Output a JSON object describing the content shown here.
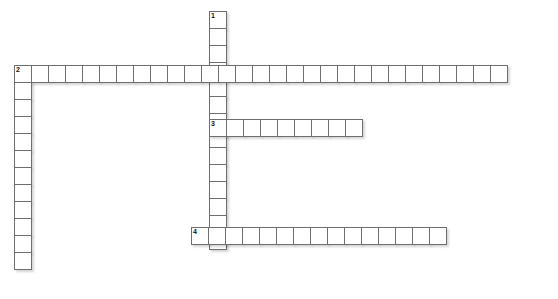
{
  "puzzle": {
    "title": "Crossword Grid",
    "width": 558,
    "height": 299,
    "cell_size": 18,
    "colors": {
      "cell_fill": "#ffffff",
      "cell_border": "#6e6e6e",
      "page_background": "#ffffff",
      "clue_number_text": "#111111",
      "shadow": "rgba(0,0,0,0.16)"
    },
    "entries": [
      {
        "number": "1",
        "direction": "down",
        "origin": {
          "x": 209,
          "y": 11
        },
        "length": 14,
        "letters": [
          "",
          "",
          "",
          "",
          "",
          "",
          "",
          "",
          "",
          "",
          "",
          "",
          "",
          ""
        ]
      },
      {
        "number": "2",
        "direction": "across",
        "origin": {
          "x": 14,
          "y": 65
        },
        "length": 29,
        "letters": [
          "",
          "",
          "",
          "",
          "",
          "",
          "",
          "",
          "",
          "",
          "",
          "",
          "",
          "",
          "",
          "",
          "",
          "",
          "",
          "",
          "",
          "",
          "",
          "",
          "",
          "",
          "",
          "",
          ""
        ]
      },
      {
        "number": "2",
        "direction": "down",
        "origin": {
          "x": 14,
          "y": 65
        },
        "length": 12,
        "letters": [
          "",
          "",
          "",
          "",
          "",
          "",
          "",
          "",
          "",
          "",
          "",
          ""
        ]
      },
      {
        "number": "3",
        "direction": "across",
        "origin": {
          "x": 209,
          "y": 119
        },
        "length": 9,
        "letters": [
          "",
          "",
          "",
          "",
          "",
          "",
          "",
          "",
          ""
        ]
      },
      {
        "number": "4",
        "direction": "across",
        "origin": {
          "x": 191,
          "y": 227
        },
        "length": 15,
        "letters": [
          "",
          "",
          "",
          "",
          "",
          "",
          "",
          "",
          "",
          "",
          "",
          "",
          "",
          "",
          ""
        ]
      }
    ],
    "clue_numbers": [
      {
        "label": "1",
        "x": 209,
        "y": 11
      },
      {
        "label": "2",
        "x": 14,
        "y": 65
      },
      {
        "label": "3",
        "x": 209,
        "y": 119
      },
      {
        "label": "4",
        "x": 191,
        "y": 227
      }
    ]
  }
}
